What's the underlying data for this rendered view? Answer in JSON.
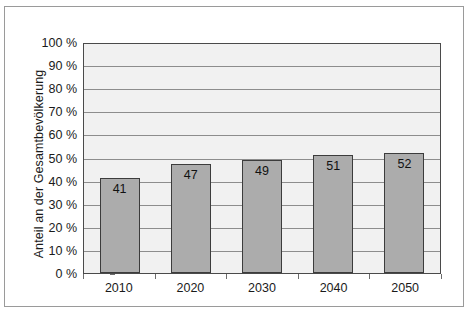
{
  "chart_data": {
    "type": "bar",
    "title": "",
    "subtitle": "",
    "xlabel": "",
    "ylabel": "Anteil an der Gesamtbevölkerung",
    "categories": [
      "2010",
      "2020",
      "2030",
      "2040",
      "2050"
    ],
    "values": [
      41,
      47,
      49,
      51,
      52
    ],
    "value_labels": [
      "41",
      "47",
      "49",
      "51",
      "52"
    ],
    "series": [
      {
        "name": "Anteil an der Gesamtbevölkerung",
        "values": [
          41,
          47,
          49,
          51,
          52
        ]
      }
    ],
    "ylim": [
      0,
      100
    ],
    "ytick_values": [
      100,
      90,
      80,
      70,
      60,
      50,
      40,
      30,
      20,
      10,
      0
    ],
    "ytick_labels": [
      "100 %",
      "90 %",
      "80 %",
      "70 %",
      "60 %",
      "50 %",
      "40 %",
      "30 %",
      "20 %",
      "10 %",
      "0 %"
    ],
    "grid": true,
    "grid_axis": "y",
    "legend": false,
    "legend_position": "none",
    "bar_color": "#acacac",
    "bar_edge_color": "#3c3c3c",
    "plot_background": "#f1f1f1",
    "gridline_color": "#8d8d8d",
    "axis_color": "#4a4a4a",
    "frame_color": "#9a9a9a",
    "text_color": "#1a1a1a",
    "value_label_position": "inside-top",
    "units": "%"
  }
}
